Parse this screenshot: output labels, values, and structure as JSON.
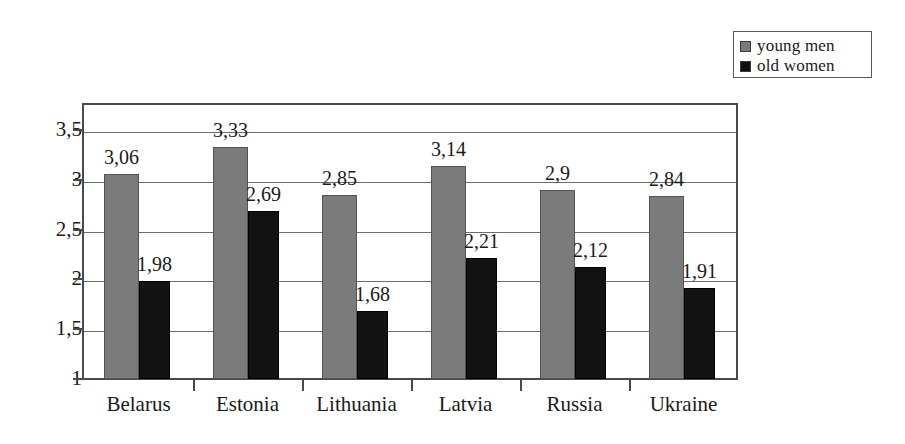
{
  "chart_data": {
    "type": "bar",
    "title": "",
    "subtitle": "",
    "xlabel": "",
    "ylabel": "",
    "categories": [
      "Belarus",
      "Estonia",
      "Lithuania",
      "Latvia",
      "Russia",
      "Ukraine"
    ],
    "series": [
      {
        "name": "young  men",
        "color": "#7b7b7b",
        "values": [
          3.06,
          3.33,
          2.85,
          3.14,
          2.9,
          2.84
        ],
        "value_labels": [
          "3,06",
          "3,33",
          "2,85",
          "3,14",
          "2,9",
          "2,84"
        ]
      },
      {
        "name": "old  women",
        "color": "#121212",
        "values": [
          1.98,
          2.69,
          1.68,
          2.21,
          2.12,
          1.91
        ],
        "value_labels": [
          "1,98",
          "2,69",
          "1,68",
          "2,21",
          "2,12",
          "1,91"
        ]
      }
    ],
    "ylim": [
      1,
      3.75
    ],
    "ytick_values": [
      1,
      1.5,
      2,
      2.5,
      3,
      3.5
    ],
    "ytick_labels": [
      "1",
      "1,5",
      "2",
      "2,5",
      "3",
      "3,5"
    ],
    "grid": true,
    "grid_axis": "y",
    "legend": {
      "position": "top-right",
      "entries": [
        "young  men",
        "old  women"
      ]
    },
    "decimal_separator": ",",
    "bar_gap_within_group": 0,
    "background_color": "#ffffff",
    "axis_color": "#4a4a4a"
  }
}
